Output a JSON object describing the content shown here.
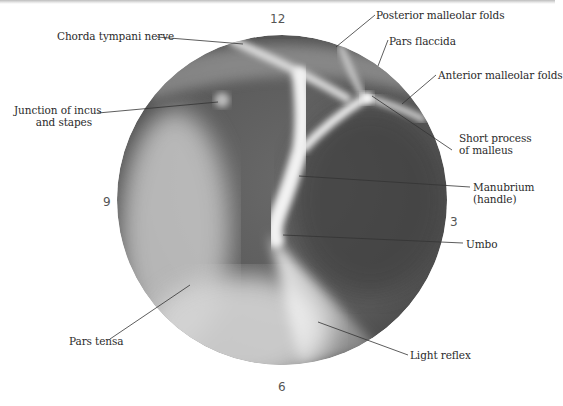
{
  "figure": {
    "clock_positions": {
      "top": "12",
      "right": "3",
      "bottom": "6",
      "left": "9"
    },
    "labels": {
      "chorda_tympani": "Chorda tympani nerve",
      "posterior_malleolar": "Posterior malleolar folds",
      "pars_flaccida": "Pars flaccida",
      "anterior_malleolar": "Anterior malleolar folds",
      "junction_line1": "Junction of incus",
      "junction_line2": "and stapes",
      "short_process_line1": "Short process",
      "short_process_line2": "of malleus",
      "manubrium_line1": "Manubrium",
      "manubrium_line2": "(handle)",
      "umbo": "Umbo",
      "pars_tensa": "Pars tensa",
      "light_reflex": "Light reflex"
    },
    "colors": {
      "membrane_dark": "#4a4a4a",
      "membrane_mid": "#8a8a8a",
      "highlight": "#f4f4f4",
      "leader": "#333333",
      "text": "#2b2b2b"
    }
  }
}
